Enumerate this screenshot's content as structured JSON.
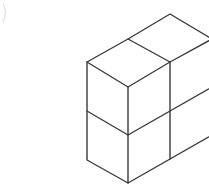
{
  "figure": {
    "type": "isometric-cube-stack",
    "colors": {
      "background": "#ffffff",
      "stroke": "#3a3a3a",
      "corner_mark": "#e2e2e2"
    },
    "cubes": {
      "rows": 2,
      "columns_right": 2,
      "depth": 1
    }
  }
}
